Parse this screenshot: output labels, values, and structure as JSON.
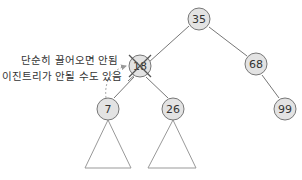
{
  "diagram": {
    "type": "binary-search-tree",
    "annotation": {
      "line1": "단순히 끌어오면 안됨",
      "line2": "이진트리가 안될 수도 있음"
    },
    "nodes": [
      {
        "id": "n35",
        "label": "35",
        "x": 199,
        "y": 19
      },
      {
        "id": "n18",
        "label": "18",
        "x": 140,
        "y": 66,
        "crossed_out": true
      },
      {
        "id": "n68",
        "label": "68",
        "x": 256,
        "y": 64
      },
      {
        "id": "n7",
        "label": "7",
        "x": 108,
        "y": 109
      },
      {
        "id": "n26",
        "label": "26",
        "x": 173,
        "y": 109
      },
      {
        "id": "n99",
        "label": "99",
        "x": 285,
        "y": 109
      }
    ],
    "edges": [
      [
        "n35",
        "n18"
      ],
      [
        "n35",
        "n68"
      ],
      [
        "n18",
        "n7"
      ],
      [
        "n18",
        "n26"
      ],
      [
        "n68",
        "n99"
      ]
    ],
    "subtrees": [
      "n7",
      "n26"
    ],
    "colors": {
      "node_fill": "#e3e3e3",
      "stroke": "#777777",
      "arrow": "#aaaaaa"
    }
  }
}
